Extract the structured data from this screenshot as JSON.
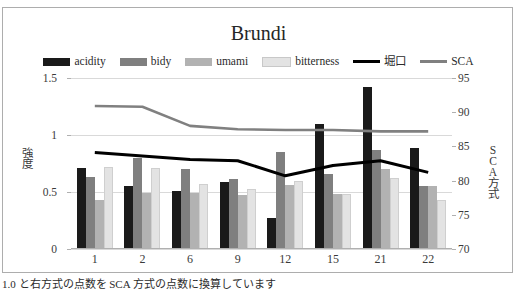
{
  "top_cut_text": "",
  "caption": "1.0 と右方式の点数を SCA 方式の点数に換算しています",
  "chart_data": {
    "type": "bar",
    "title": "Brundi",
    "xlabel": "",
    "ylabel": "強度",
    "y2label": "SCA方式",
    "grid": true,
    "legend_position": "top",
    "categories": [
      "1",
      "2",
      "6",
      "9",
      "12",
      "15",
      "21",
      "22"
    ],
    "ylim": [
      0,
      1.5
    ],
    "yticks": [
      "0",
      "0.5",
      "1",
      "1.5"
    ],
    "y2lim": [
      70,
      95
    ],
    "y2ticks": [
      "70",
      "75",
      "80",
      "85",
      "90",
      "95"
    ],
    "series": [
      {
        "name": "acidity",
        "type": "bar",
        "axis": "left",
        "color": "#1a1a1a",
        "values": [
          0.71,
          0.55,
          0.51,
          0.59,
          0.27,
          1.1,
          1.42,
          0.89
        ]
      },
      {
        "name": "bidy",
        "type": "bar",
        "axis": "left",
        "color": "#7f7f7f",
        "values": [
          0.63,
          0.8,
          0.7,
          0.61,
          0.85,
          0.66,
          0.87,
          0.55
        ]
      },
      {
        "name": "umami",
        "type": "bar",
        "axis": "left",
        "color": "#b2b2b2",
        "values": [
          0.43,
          0.49,
          0.49,
          0.47,
          0.56,
          0.48,
          0.7,
          0.55
        ]
      },
      {
        "name": "bitterness",
        "type": "bar",
        "axis": "left",
        "color": "#e3e3e3",
        "values": [
          0.72,
          0.71,
          0.57,
          0.53,
          0.6,
          0.48,
          0.62,
          0.43
        ]
      },
      {
        "name": "堀口",
        "type": "line",
        "axis": "right",
        "color": "#000000",
        "values": [
          84.1,
          83.6,
          83.1,
          82.9,
          80.7,
          82.2,
          82.9,
          81.2
        ]
      },
      {
        "name": "SCA",
        "type": "line",
        "axis": "right",
        "color": "#808080",
        "values": [
          90.9,
          90.8,
          88.0,
          87.5,
          87.4,
          87.4,
          87.2,
          87.2
        ]
      }
    ]
  }
}
